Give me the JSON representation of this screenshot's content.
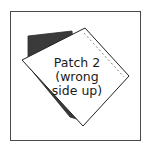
{
  "diagram": {
    "label_lines": [
      "Patch 2",
      "(wrong",
      "side up)"
    ],
    "colors": {
      "frame": "#4a4a4a",
      "dark_patch": "#3a3a3a",
      "white_patch": "#ffffff",
      "outline": "#222222",
      "seam": "#777777"
    }
  }
}
